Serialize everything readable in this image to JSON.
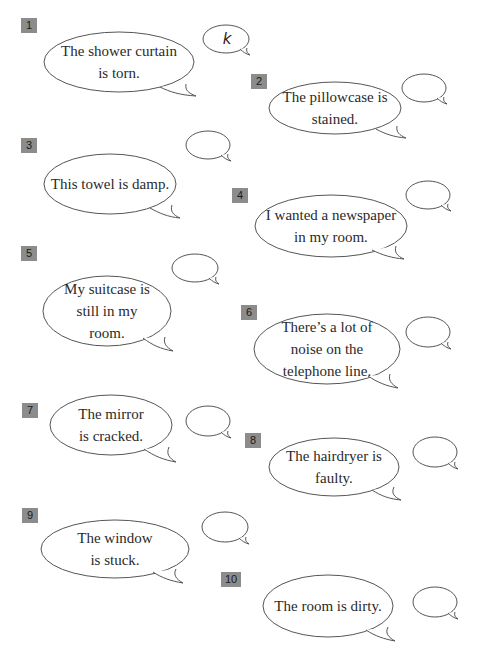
{
  "exercise": {
    "items": [
      {
        "number": "1",
        "sentence": "The shower curtain is torn.",
        "lines": [
          "The shower curtain",
          "is torn."
        ],
        "answer": "k"
      },
      {
        "number": "2",
        "sentence": "The pillowcase is stained.",
        "lines": [
          "The pillowcase is",
          "stained."
        ],
        "answer": ""
      },
      {
        "number": "3",
        "sentence": "This towel is damp.",
        "lines": [
          "This towel is damp."
        ],
        "answer": ""
      },
      {
        "number": "4",
        "sentence": "I wanted a newspaper in my room.",
        "lines": [
          "I wanted a newspaper",
          "in my room."
        ],
        "answer": ""
      },
      {
        "number": "5",
        "sentence": "My suitcase is still in my room.",
        "lines": [
          "My suitcase is",
          "still in my",
          "room."
        ],
        "answer": ""
      },
      {
        "number": "6",
        "sentence": "There's a lot of noise on the telephone line.",
        "lines": [
          "There’s a lot of",
          "noise on the",
          "telephone line."
        ],
        "answer": ""
      },
      {
        "number": "7",
        "sentence": "The mirror is cracked.",
        "lines": [
          "The mirror",
          "is cracked."
        ],
        "answer": ""
      },
      {
        "number": "8",
        "sentence": "The hairdryer is faulty.",
        "lines": [
          "The hairdryer is",
          "faulty."
        ],
        "answer": ""
      },
      {
        "number": "9",
        "sentence": "The window is stuck.",
        "lines": [
          "The window",
          "is stuck."
        ],
        "answer": ""
      },
      {
        "number": "10",
        "sentence": "The room is dirty.",
        "lines": [
          "The room is dirty."
        ],
        "answer": ""
      }
    ]
  },
  "colors": {
    "badge_bg": "#8c8c8c",
    "outline": "#555555",
    "text": "#2a2a2a"
  }
}
